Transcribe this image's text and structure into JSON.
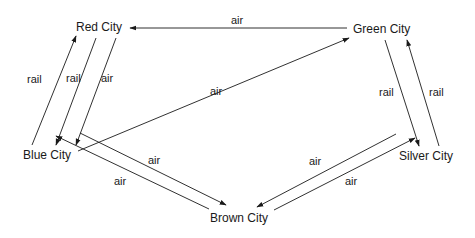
{
  "cities": {
    "red": "Red City",
    "green": "Green City",
    "blue": "Blue City",
    "silver": "Silver City",
    "brown": "Brown City"
  },
  "edges": [
    {
      "from": "Green City",
      "to": "Red City",
      "mode": "air"
    },
    {
      "from": "Blue City",
      "to": "Red City",
      "mode": "rail"
    },
    {
      "from": "Red City",
      "to": "Blue City",
      "mode": "rail"
    },
    {
      "from": "Red City",
      "to": "Blue City",
      "mode": "air"
    },
    {
      "from": "Blue City",
      "to": "Green City",
      "mode": "air"
    },
    {
      "from": "Green City",
      "to": "Silver City",
      "mode": "rail"
    },
    {
      "from": "Silver City",
      "to": "Green City",
      "mode": "rail"
    },
    {
      "from": "Blue City",
      "to": "Brown City",
      "mode": "air"
    },
    {
      "from": "Brown City",
      "to": "Blue City",
      "mode": "air"
    },
    {
      "from": "Silver City",
      "to": "Brown City",
      "mode": "air"
    },
    {
      "from": "Brown City",
      "to": "Silver City",
      "mode": "air"
    }
  ],
  "labels": {
    "green_red": "air",
    "blue_red_rail": "rail",
    "red_blue_rail": "rail",
    "red_blue_air": "air",
    "blue_green": "air",
    "green_silver_rail": "rail",
    "silver_green_rail": "rail",
    "blue_brown_air": "air",
    "brown_blue_air": "air",
    "silver_brown_air": "air",
    "brown_silver_air": "air"
  }
}
